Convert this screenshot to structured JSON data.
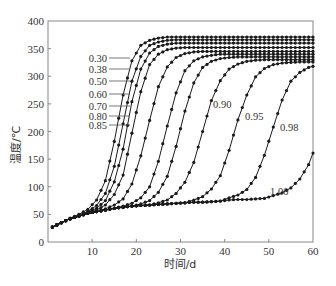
{
  "chart_data": {
    "type": "line",
    "title": "",
    "xlabel": "时间/d",
    "ylabel": "温度/℃",
    "xlim": [
      0,
      60
    ],
    "ylim": [
      0,
      400
    ],
    "xticks": [
      10,
      20,
      30,
      40,
      50,
      60
    ],
    "yticks": [
      0,
      50,
      100,
      150,
      200,
      250,
      300,
      350,
      400
    ],
    "grid": false,
    "legend": "inline curve labels",
    "x": [
      1,
      3,
      5,
      7,
      9,
      11,
      13,
      15,
      17,
      19,
      21,
      23,
      25,
      27,
      29,
      31,
      33,
      35,
      37,
      39,
      41,
      43,
      45,
      47,
      49,
      51,
      53,
      55,
      57,
      59
    ],
    "series": [
      {
        "name": "0.30",
        "values": [
          27,
          35,
          43,
          50,
          59,
          76,
          111,
          182,
          266,
          328,
          356,
          365,
          369,
          371,
          371,
          371,
          371,
          371,
          371,
          371,
          371,
          371,
          371,
          371,
          371,
          371,
          371,
          371,
          371,
          371
        ]
      },
      {
        "name": "0.38",
        "values": [
          27,
          35,
          42,
          48,
          55,
          66,
          88,
          137,
          214,
          291,
          336,
          356,
          362,
          365,
          366,
          366,
          366,
          366,
          366,
          366,
          366,
          366,
          366,
          366,
          366,
          366,
          366,
          366,
          366,
          366
        ]
      },
      {
        "name": "0.50",
        "values": [
          27,
          35,
          42,
          47,
          54,
          61,
          75,
          109,
          168,
          254,
          313,
          342,
          354,
          358,
          360,
          360,
          360,
          360,
          360,
          360,
          360,
          360,
          360,
          360,
          360,
          360,
          360,
          360,
          360,
          360
        ]
      },
      {
        "name": "0.60",
        "values": [
          27,
          35,
          42,
          47,
          52,
          58,
          67,
          86,
          121,
          197,
          272,
          321,
          340,
          348,
          351,
          352,
          352,
          352,
          352,
          352,
          352,
          352,
          352,
          352,
          352,
          352,
          352,
          352,
          352,
          352
        ]
      },
      {
        "name": "0.70",
        "values": [
          27,
          35,
          42,
          47,
          52,
          55,
          60,
          67,
          78,
          105,
          156,
          220,
          281,
          317,
          334,
          341,
          344,
          345,
          345,
          345,
          345,
          345,
          345,
          345,
          345,
          345,
          345,
          345,
          345,
          345
        ]
      },
      {
        "name": "0.80",
        "values": [
          27,
          35,
          42,
          47,
          52,
          55,
          58,
          61,
          65,
          70,
          80,
          100,
          146,
          210,
          270,
          310,
          328,
          335,
          338,
          340,
          340,
          340,
          340,
          340,
          340,
          340,
          340,
          340,
          340,
          340
        ]
      },
      {
        "name": "0.85",
        "values": [
          27,
          35,
          42,
          47,
          52,
          55,
          58,
          61,
          63,
          65,
          69,
          75,
          90,
          119,
          173,
          237,
          288,
          316,
          327,
          332,
          334,
          335,
          335,
          335,
          335,
          335,
          335,
          335,
          335,
          335
        ]
      },
      {
        "name": "0.90",
        "values": [
          27,
          35,
          42,
          47,
          52,
          55,
          58,
          61,
          63,
          65,
          66,
          67,
          71,
          76,
          88,
          108,
          144,
          200,
          256,
          292,
          313,
          322,
          327,
          329,
          330,
          330,
          330,
          330,
          330,
          330
        ]
      },
      {
        "name": "0.95",
        "values": [
          27,
          35,
          42,
          47,
          52,
          55,
          58,
          61,
          63,
          65,
          66,
          67,
          68,
          69,
          70,
          71,
          76,
          82,
          96,
          120,
          166,
          221,
          266,
          299,
          314,
          321,
          324,
          325,
          326,
          326
        ]
      },
      {
        "name": "0.98",
        "values": [
          27,
          35,
          42,
          47,
          52,
          55,
          58,
          61,
          63,
          65,
          66,
          67,
          68,
          69,
          70,
          71,
          72,
          72,
          73,
          74,
          80,
          85,
          95,
          117,
          157,
          208,
          257,
          291,
          307,
          316
        ]
      },
      {
        "name": "1.00",
        "values": [
          27,
          35,
          42,
          47,
          52,
          55,
          58,
          61,
          63,
          65,
          66,
          67,
          68,
          69,
          70,
          71,
          72,
          72,
          73,
          74,
          76,
          77,
          77,
          78,
          79,
          84,
          89,
          98,
          114,
          140
        ]
      }
    ],
    "series_end": {
      "x": 60,
      "1.00": 161,
      "0.98": 318
    }
  },
  "labels": {
    "left": [
      {
        "text": "0.30",
        "y": 58
      },
      {
        "text": "0.38",
        "y": 69
      },
      {
        "text": "0.50",
        "y": 81
      },
      {
        "text": "0.60",
        "y": 94
      },
      {
        "text": "0.70",
        "y": 106
      },
      {
        "text": "0.80",
        "y": 116
      },
      {
        "text": "0.85",
        "y": 125
      }
    ],
    "inline": [
      {
        "text": "0.90",
        "x": 213,
        "y": 104
      },
      {
        "text": "0.95",
        "x": 245,
        "y": 116
      },
      {
        "text": "0.98",
        "x": 280,
        "y": 127
      },
      {
        "text": "1.00",
        "x": 270,
        "y": 191
      }
    ]
  },
  "colors": {
    "line": "#1a1a1a",
    "axis": "#888888",
    "text": "#333333"
  }
}
